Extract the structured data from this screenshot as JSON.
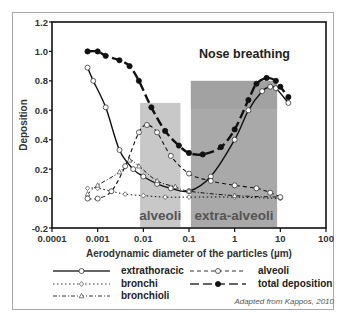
{
  "chart_data": {
    "type": "line",
    "title": "Nose breathing",
    "xlabel": "Aerodynamic diameter of the particles (µm)",
    "ylabel": "Deposition",
    "xscale": "log",
    "xlim": [
      0.0001,
      100
    ],
    "ylim": [
      -0.2,
      1.2
    ],
    "xticks": [
      "0.0001",
      "0.001",
      "0.01",
      "0.1",
      "1",
      "10",
      "100"
    ],
    "xtick_values": [
      0.0001,
      0.001,
      0.01,
      0.1,
      1,
      10,
      100
    ],
    "yticks": [
      "-0.2",
      "0.0",
      "0.2",
      "0.4",
      "0.6",
      "0.8",
      "1.0",
      "1.2"
    ],
    "ytick_values": [
      -0.2,
      0.0,
      0.2,
      0.4,
      0.6,
      0.8,
      1.0,
      1.2
    ],
    "grid": false,
    "legend_position": "bottom",
    "regions": [
      {
        "label": "alveoli",
        "x0": 0.0085,
        "x1": 0.065,
        "ytop": 0.65,
        "color": "#c8c8c8"
      },
      {
        "label": "extra-alveoli",
        "x0": 0.11,
        "x1": 8.5,
        "ytop": 0.8,
        "color": "#a9a9a9"
      }
    ],
    "series": [
      {
        "name": "extrathoracic",
        "style": "solid",
        "marker": "open-circle",
        "x": [
          0.0006,
          0.0008,
          0.0015,
          0.003,
          0.006,
          0.01,
          0.02,
          0.04,
          0.1,
          0.3,
          1,
          2,
          4,
          6,
          8,
          15
        ],
        "y": [
          0.89,
          0.8,
          0.62,
          0.33,
          0.2,
          0.15,
          0.1,
          0.07,
          0.05,
          0.15,
          0.4,
          0.6,
          0.73,
          0.76,
          0.75,
          0.65
        ]
      },
      {
        "name": "bronchi",
        "style": "dotted",
        "marker": "open-diamond",
        "x": [
          0.0006,
          0.001,
          0.002,
          0.004,
          0.01,
          0.03,
          0.1,
          1,
          10
        ],
        "y": [
          0.07,
          0.07,
          0.05,
          0.03,
          0.02,
          0.01,
          0.01,
          0.01,
          0.0
        ]
      },
      {
        "name": "bronchioli",
        "style": "dash-dot",
        "marker": "open-triangle",
        "x": [
          0.0006,
          0.001,
          0.003,
          0.005,
          0.008,
          0.02,
          0.05,
          0.1,
          1,
          10
        ],
        "y": [
          0.03,
          0.09,
          0.18,
          0.26,
          0.22,
          0.12,
          0.08,
          0.05,
          0.02,
          0.01
        ]
      },
      {
        "name": "alveoli",
        "style": "dashed",
        "marker": "open-circle",
        "x": [
          0.0006,
          0.001,
          0.002,
          0.004,
          0.008,
          0.012,
          0.02,
          0.04,
          0.1,
          0.3,
          1,
          3,
          6,
          10
        ],
        "y": [
          0.0,
          0.0,
          0.05,
          0.22,
          0.45,
          0.5,
          0.45,
          0.29,
          0.17,
          0.12,
          0.09,
          0.07,
          0.04,
          0.01
        ]
      },
      {
        "name": "total deposition",
        "style": "long-dash",
        "marker": "filled-circle",
        "x": [
          0.0006,
          0.001,
          0.0015,
          0.003,
          0.005,
          0.008,
          0.015,
          0.03,
          0.06,
          0.1,
          0.2,
          0.5,
          1,
          2,
          3,
          5,
          8,
          10,
          15
        ],
        "y": [
          1.0,
          1.0,
          0.97,
          0.94,
          0.9,
          0.8,
          0.62,
          0.46,
          0.36,
          0.31,
          0.3,
          0.35,
          0.47,
          0.67,
          0.78,
          0.82,
          0.8,
          0.76,
          0.69
        ]
      }
    ],
    "annotations": [
      "Nose breathing",
      "alveoli",
      "extra-alveoli"
    ]
  },
  "legend": {
    "items": [
      {
        "label": "extrathoracic"
      },
      {
        "label": "bronchi"
      },
      {
        "label": "bronchioli"
      },
      {
        "label": "alveoli"
      },
      {
        "label": "total deposition"
      }
    ]
  },
  "credit": "Adapted from Kappos, 2010"
}
